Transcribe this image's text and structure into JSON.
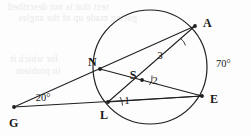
{
  "figure": {
    "type": "circle-geometry-diagram",
    "stroke_color": "#1f1f1f",
    "background_color": "#fdfdfd",
    "circle": {
      "cx": 150,
      "cy": 67,
      "r": 57
    },
    "points": [
      {
        "name": "A",
        "label": "A",
        "x": 195,
        "y": 26,
        "label_x": 203,
        "label_y": 27,
        "on_circle": true
      },
      {
        "name": "N",
        "label": "N",
        "x": 100,
        "y": 69,
        "label_x": 88,
        "label_y": 66,
        "on_circle": true
      },
      {
        "name": "E",
        "label": "E",
        "x": 202,
        "y": 96,
        "label_x": 210,
        "label_y": 103,
        "on_circle": true
      },
      {
        "name": "L",
        "label": "L",
        "x": 108,
        "y": 102,
        "label_x": 104,
        "label_y": 119,
        "on_circle": true
      },
      {
        "name": "S",
        "label": "S",
        "x": 142,
        "y": 80,
        "label_x": 133,
        "label_y": 79,
        "on_circle": false
      },
      {
        "name": "G",
        "label": "G",
        "x": 14,
        "y": 107,
        "label_x": 9,
        "label_y": 127,
        "on_circle": false
      }
    ],
    "segments": [
      {
        "name": "secant-G-A",
        "from": "G",
        "to": "A"
      },
      {
        "name": "secant-G-E",
        "from": "G",
        "to": "E"
      },
      {
        "name": "chord-N-E",
        "from": "N",
        "to": "E"
      },
      {
        "name": "chord-A-L",
        "from": "A",
        "to": "L"
      },
      {
        "name": "chord-L-E",
        "from": "L",
        "to": "E"
      }
    ],
    "angle_labels": [
      {
        "name": "angle-1",
        "text": "1",
        "x": 121,
        "y": 102,
        "vertex": "L"
      },
      {
        "name": "angle-2",
        "text": "2",
        "x": 151,
        "y": 83,
        "vertex": "S"
      },
      {
        "name": "angle-3",
        "text": "3",
        "x": 157,
        "y": 58,
        "vertex": "A"
      }
    ],
    "measure_labels": [
      {
        "name": "angle-G-measure",
        "text": "20°",
        "x": 43,
        "y": 100
      },
      {
        "name": "arc-A-E-measure",
        "text": "70°",
        "x": 216,
        "y": 66
      }
    ]
  },
  "page_bleed_through": {
    "visible": true,
    "note": "faint mirrored text showing through from reverse side of page",
    "lines": [
      {
        "text": "text that is not described",
        "x": 8,
        "y": 4
      },
      {
        "text": "guring made up of the angles",
        "x": 18,
        "y": 15
      },
      {
        "text": "for which it",
        "x": 10,
        "y": 56
      },
      {
        "text": "in problem",
        "x": 16,
        "y": 68
      }
    ]
  }
}
